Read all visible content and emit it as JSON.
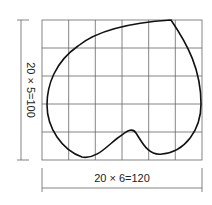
{
  "diagram": {
    "grid": {
      "columns": 6,
      "rows": 5,
      "cell_size": 20
    },
    "dimensions": {
      "horizontal_label": "20 × 6=120",
      "vertical_label": "20 × 5=100"
    },
    "colors": {
      "grid": "#555555",
      "curve": "#111111",
      "dim": "#555555"
    },
    "shape": "heart-like closed curve over grid"
  }
}
